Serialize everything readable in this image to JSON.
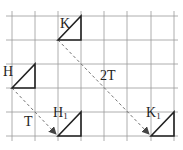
{
  "diagram": {
    "grid": {
      "x_lines": [
        12,
        35,
        58,
        81,
        104,
        127,
        151,
        174
      ],
      "y_lines": [
        16,
        40,
        64,
        88,
        112,
        136
      ],
      "color": "#999999"
    },
    "labels": {
      "K": "K",
      "H": "H",
      "H1": "H",
      "H1_sub": "1",
      "K1": "K",
      "K1_sub": "1",
      "T": "T",
      "twoT": "2T"
    },
    "shapes": [
      {
        "name": "K",
        "points": [
          [
            58,
            40
          ],
          [
            81,
            16
          ],
          [
            81,
            40
          ]
        ]
      },
      {
        "name": "H",
        "points": [
          [
            12,
            88
          ],
          [
            35,
            64
          ],
          [
            35,
            88
          ]
        ]
      },
      {
        "name": "H1",
        "points": [
          [
            58,
            136
          ],
          [
            81,
            112
          ],
          [
            81,
            136
          ]
        ]
      },
      {
        "name": "K1",
        "points": [
          [
            151,
            136
          ],
          [
            174,
            112
          ],
          [
            174,
            136
          ]
        ]
      }
    ],
    "vectors": [
      {
        "from": "H",
        "to": "H1",
        "label": "T"
      },
      {
        "from": "K",
        "to": "K1",
        "label": "2T"
      }
    ],
    "colors": {
      "shape_stroke": "#222222",
      "arrow": "#555555"
    }
  }
}
